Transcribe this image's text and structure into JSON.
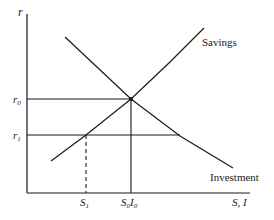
{
  "diagram": {
    "type": "savings-investment",
    "axes": {
      "y_label": "r",
      "x_label": "S, I",
      "origin": [
        27,
        193
      ],
      "y_top": 14,
      "x_right": 250
    },
    "curves": {
      "savings": {
        "label": "Savings",
        "points": [
          [
            51,
            161
          ],
          [
            86,
            135
          ],
          [
            131,
            99
          ],
          [
            170,
            62
          ],
          [
            204,
            28
          ]
        ]
      },
      "investment": {
        "label": "Investment",
        "points": [
          [
            65,
            37
          ],
          [
            131,
            99
          ],
          [
            180,
            136
          ],
          [
            233,
            168
          ]
        ]
      }
    },
    "levels": {
      "r0": {
        "label": "r",
        "sub": "0",
        "y": 99,
        "x_end": 131
      },
      "r1": {
        "label": "r",
        "sub": "1",
        "y": 135,
        "x_end": 180
      }
    },
    "markers": {
      "s1": {
        "label": "S",
        "sub": "1",
        "x": 86,
        "from_y": 135,
        "dashed": true
      },
      "s0i0": {
        "label_a": "S",
        "sub_a": "0",
        "label_b": "I",
        "sub_b": "0",
        "x": 131,
        "from_y": 99,
        "dashed": false
      }
    },
    "colors": {
      "ink": "#1a1a1a",
      "background": "#ffffff"
    }
  }
}
